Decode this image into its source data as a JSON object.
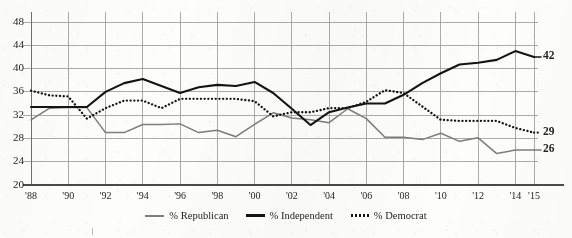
{
  "chart_data": {
    "type": "line",
    "title": "",
    "xlabel": "",
    "ylabel": "",
    "ylim": [
      20,
      48
    ],
    "ytick_values": [
      20,
      24,
      28,
      32,
      36,
      40,
      44,
      48
    ],
    "ytick_labels": [
      "20",
      "24",
      "28",
      "32",
      "36",
      "40",
      "44",
      "48"
    ],
    "grid": true,
    "legend_position": "bottom-center",
    "x": [
      1988,
      1989,
      1990,
      1991,
      1992,
      1993,
      1994,
      1995,
      1996,
      1997,
      1998,
      1999,
      2000,
      2001,
      2002,
      2003,
      2004,
      2005,
      2006,
      2007,
      2008,
      2009,
      2010,
      2011,
      2012,
      2013,
      2014,
      2015
    ],
    "xtick_positions": [
      1988,
      1990,
      1992,
      1994,
      1996,
      1998,
      2000,
      2002,
      2004,
      2006,
      2008,
      2010,
      2012,
      2014,
      2015
    ],
    "xtick_labels": [
      "'88",
      "'90",
      "'92",
      "'94",
      "'96",
      "'98",
      "'00",
      "'02",
      "'04",
      "'06",
      "'08",
      "'10",
      "'12",
      "'14",
      "'15"
    ],
    "series": [
      {
        "name": "% Republican",
        "color": "#7d7d7d",
        "style": "solid",
        "end_label": "26",
        "values": [
          31.2,
          33.2,
          33.3,
          33.3,
          29.0,
          29.0,
          30.4,
          30.4,
          30.5,
          29.0,
          29.4,
          28.3,
          30.4,
          32.4,
          31.5,
          31.2,
          30.7,
          33.1,
          31.4,
          28.2,
          28.2,
          27.8,
          28.9,
          27.5,
          28.1,
          25.4,
          26.0,
          26.0
        ]
      },
      {
        "name": "% Independent",
        "color": "#141414",
        "style": "solid",
        "end_label": "42",
        "values": [
          33.4,
          33.4,
          33.4,
          33.4,
          36.0,
          37.5,
          38.2,
          37.0,
          35.8,
          36.8,
          37.2,
          37.0,
          37.7,
          35.8,
          33.1,
          30.3,
          32.5,
          33.3,
          34.0,
          34.0,
          35.5,
          37.5,
          39.2,
          40.7,
          41.0,
          41.5,
          43.0,
          42.0
        ]
      },
      {
        "name": "% Democrat",
        "color": "#141414",
        "style": "dotted",
        "end_label": "29",
        "values": [
          36.2,
          35.4,
          35.2,
          31.4,
          33.2,
          34.5,
          34.5,
          33.2,
          34.8,
          34.8,
          34.8,
          34.8,
          34.4,
          31.8,
          32.5,
          32.5,
          33.2,
          33.2,
          34.3,
          36.3,
          35.8,
          33.5,
          31.2,
          31.0,
          31.0,
          31.0,
          29.8,
          29.0
        ]
      }
    ]
  },
  "legend": {
    "items": [
      {
        "label": "% Republican",
        "swatch": "solid-gray"
      },
      {
        "label": "% Independent",
        "swatch": "solid-black"
      },
      {
        "label": "% Democrat",
        "swatch": "dotted-black"
      }
    ]
  }
}
